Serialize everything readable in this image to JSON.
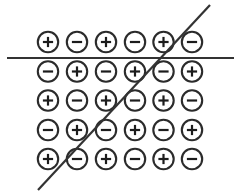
{
  "figure": {
    "canvas": {
      "width": 241,
      "height": 193,
      "background": "#ffffff"
    },
    "style": {
      "circle_stroke_color": "#2b2b2b",
      "circle_stroke_width": 2.1,
      "circle_radius": 10.2,
      "circle_fill": "#ffffff",
      "glyph_color": "#1c1c1c",
      "glyph_stroke_width": 2.2,
      "glyph_arm": 5.1,
      "line_color": "#333333",
      "line_width": 2.2
    },
    "grid": {
      "rows": 5,
      "columns": 6,
      "column_centers_x": [
        48,
        77,
        106,
        135,
        163.5,
        192
      ],
      "row_centers_y": [
        42,
        71.5,
        100.5,
        130,
        159
      ],
      "pattern_description": "checkerboard alternating plus and minus, starting with plus at top-left",
      "cells": [
        [
          {
            "sign": "+",
            "label": "plus"
          },
          {
            "sign": "-",
            "label": "minus"
          },
          {
            "sign": "+",
            "label": "plus"
          },
          {
            "sign": "-",
            "label": "minus"
          },
          {
            "sign": "+",
            "label": "plus"
          },
          {
            "sign": "-",
            "label": "minus"
          }
        ],
        [
          {
            "sign": "-",
            "label": "minus"
          },
          {
            "sign": "+",
            "label": "plus"
          },
          {
            "sign": "-",
            "label": "minus"
          },
          {
            "sign": "+",
            "label": "plus"
          },
          {
            "sign": "-",
            "label": "minus"
          },
          {
            "sign": "+",
            "label": "plus"
          }
        ],
        [
          {
            "sign": "+",
            "label": "plus"
          },
          {
            "sign": "-",
            "label": "minus"
          },
          {
            "sign": "+",
            "label": "plus"
          },
          {
            "sign": "-",
            "label": "minus"
          },
          {
            "sign": "+",
            "label": "plus"
          },
          {
            "sign": "-",
            "label": "minus"
          }
        ],
        [
          {
            "sign": "-",
            "label": "minus"
          },
          {
            "sign": "+",
            "label": "plus"
          },
          {
            "sign": "-",
            "label": "minus"
          },
          {
            "sign": "+",
            "label": "plus"
          },
          {
            "sign": "-",
            "label": "minus"
          },
          {
            "sign": "+",
            "label": "plus"
          }
        ],
        [
          {
            "sign": "+",
            "label": "plus"
          },
          {
            "sign": "-",
            "label": "minus"
          },
          {
            "sign": "+",
            "label": "plus"
          },
          {
            "sign": "-",
            "label": "minus"
          },
          {
            "sign": "+",
            "label": "plus"
          },
          {
            "sign": "-",
            "label": "minus"
          }
        ]
      ]
    },
    "lines": [
      {
        "name": "horizontal-cut-line",
        "orientation": "horizontal",
        "x1": 7,
        "y1": 58,
        "x2": 234,
        "y2": 58
      },
      {
        "name": "diagonal-cut-line",
        "orientation": "diagonal",
        "x1": 38,
        "y1": 190,
        "x2": 210,
        "y2": 5
      }
    ]
  }
}
